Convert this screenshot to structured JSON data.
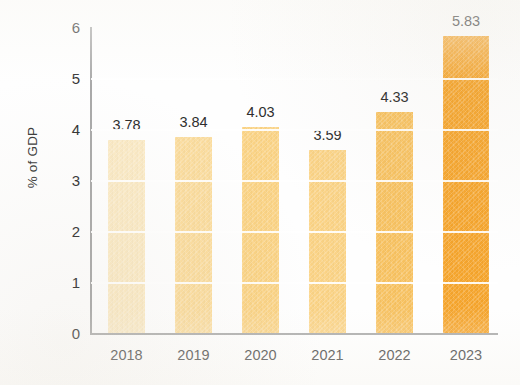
{
  "chart_data": {
    "type": "bar",
    "title": "",
    "subtitle": "",
    "xlabel": "",
    "ylabel": "% of GDP",
    "categories": [
      "2018",
      "2019",
      "2020",
      "2021",
      "2022",
      "2023"
    ],
    "values": [
      3.78,
      3.84,
      4.03,
      3.59,
      4.33,
      5.83
    ],
    "value_labels": [
      "3.78",
      "3.84",
      "4.03",
      "3.59",
      "4.33",
      "5.83"
    ],
    "ylim": [
      0,
      6
    ],
    "yticks": [
      0,
      1,
      2,
      3,
      4,
      5,
      6
    ],
    "ytick_labels": [
      "0",
      "1",
      "2",
      "3",
      "4",
      "5",
      "6"
    ],
    "grid": "horizontal-white-over-bars",
    "legend": "none",
    "series": [
      {
        "name": "% of GDP",
        "values": [
          3.78,
          3.84,
          4.03,
          3.59,
          4.33,
          5.83
        ]
      }
    ],
    "bar_colors": [
      "#FBEAC4",
      "#FBDC9C",
      "#FBD384",
      "#FBD385",
      "#F8C260",
      "#F6A52C"
    ],
    "axis_color": "#A9A9A9",
    "text_color": "#333333",
    "background": "#FFFFFF"
  },
  "axis": {
    "y_title": "% of GDP"
  }
}
